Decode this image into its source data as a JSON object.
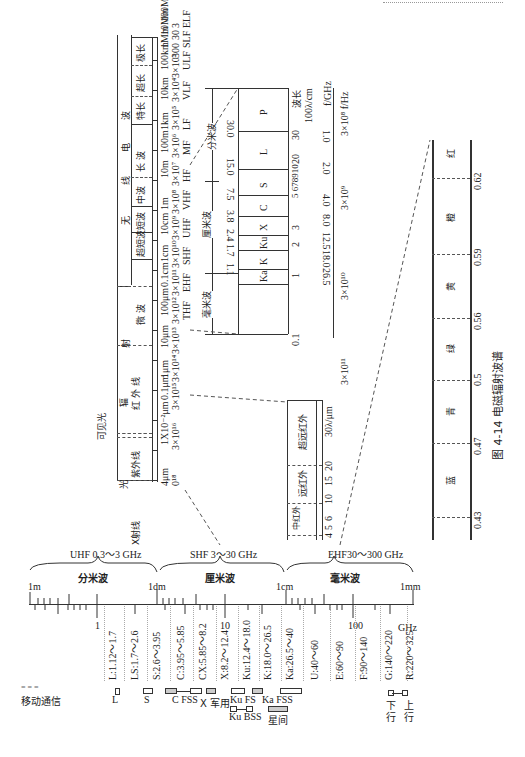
{
  "figure": {
    "caption": "图 4-14   电磁辐射波谱"
  },
  "top_band_table": {
    "group_label": "无线电波",
    "group_chars": [
      "无",
      "线",
      "电",
      "波"
    ],
    "radiation_label": "辐射",
    "radiation_chars": [
      "辐",
      "射"
    ],
    "light_chars": [
      "光"
    ],
    "visible_label": "可见光",
    "bands": [
      "X射线",
      "紫外线",
      "红 外 线",
      "微 波",
      "超短波",
      "短波",
      "中波",
      "长 波",
      "特长",
      "超长",
      "极长"
    ],
    "wavelengths": [
      "4μm",
      "1X10⁻²μm",
      "0.1μm",
      "1μm",
      "10μm",
      "100μm",
      "0.1cm",
      "1cm",
      "10cm",
      "1m",
      "10m",
      "100m",
      "1km",
      "10km",
      "100km",
      "1Mm",
      "10Mm",
      "100Mm"
    ],
    "frequencies": [
      "0¹⁸",
      "3×10¹⁶",
      "3×10¹⁵",
      "3×10¹⁴",
      "3×10¹³",
      "3×10¹²",
      "3×10¹¹",
      "3×10¹⁰",
      "3×10⁹",
      "3×10⁸",
      "3×10⁷",
      "3×10⁶",
      "3×10⁵",
      "3×10⁴",
      "3×10³",
      "300",
      "30",
      "3"
    ],
    "designations": [
      "THF",
      "EHF",
      "SHF",
      "UHF",
      "VHF",
      "HF",
      "MF",
      "LF",
      "VLF",
      "ULF",
      "SLF",
      "ELF"
    ]
  },
  "microwave_detail": {
    "wavelength_header": "波长",
    "wavelength_unit": "100λ/cm",
    "freq_unit_ghz": "f/GHz",
    "freq_unit_hz": "3×10⁸ f/Hz",
    "ranges": [
      "分米波",
      "厘米波",
      "毫米波"
    ],
    "bands": [
      "P",
      "L",
      "S",
      "C",
      "X",
      "Ku",
      "K",
      "Ka"
    ],
    "boundary_freqs": [
      "30.0",
      "15.0",
      "7.5",
      "3.8",
      "2.4",
      "1.7",
      "1.1"
    ],
    "wavelength_ticks": [
      "30",
      "20",
      "10",
      "9",
      "8",
      "7",
      "6",
      "5",
      "4",
      "3",
      "2",
      "1",
      "0.1"
    ],
    "ghz_ticks": [
      "1.0",
      "2.0",
      "4.0",
      "8.0",
      "12.5",
      "18.0",
      "26.5"
    ],
    "hz_ticks": [
      "3×10⁹",
      "3×10¹⁰",
      "3×10¹¹"
    ]
  },
  "infrared_detail": {
    "bands": [
      "超远红外",
      "远红外",
      "中红外"
    ],
    "ticks": [
      "30λ/μm",
      "20",
      "15",
      "10",
      "6",
      "5",
      "4",
      "3"
    ]
  },
  "visible_detail": {
    "colors": [
      "红",
      "橙",
      "黄",
      "绿",
      "青",
      "蓝"
    ],
    "boundaries": [
      "0.62",
      "0.59",
      "0.56",
      "0.5",
      "0.47",
      "0.43"
    ]
  },
  "bottom_scale": {
    "uhf_label": "UHF 0.3～3 GHz",
    "shf_label": "SHF 3～30  GHz",
    "ehf_label": "EHF30～300 GHz",
    "range_labels": [
      "分米波",
      "厘米波",
      "毫米波"
    ],
    "length_marks": [
      "1m",
      "1dm",
      "1cm",
      "1mm"
    ],
    "freq_marks": [
      "1",
      "10",
      "100",
      "GHz"
    ],
    "bands": [
      "L:1.12～1.7",
      "LS:1.7～2.6",
      "S:2.6～3.95",
      "C:3.95～5.85",
      "CX:5.85～8.2",
      "X:8.2～12.4",
      "Ku:12.4～18.0",
      "K:18.0～26.5",
      "Ka:26.5～40",
      "U:40～60",
      "E:60～90",
      "F:90～140",
      "G:140～220",
      "R:220～325"
    ],
    "legend_dashes": "= = =",
    "legend_label": "移动通信",
    "service_labels_row1": [
      "L",
      "S",
      "C FSS",
      "X 军用",
      "Ku FS",
      "Ka FSS"
    ],
    "service_labels_row2": [
      "Ku BSS",
      "星间"
    ],
    "link_labels": [
      "下行",
      "上行"
    ],
    "link_chars": [
      [
        "下",
        "行"
      ],
      [
        "上",
        "行"
      ]
    ]
  }
}
